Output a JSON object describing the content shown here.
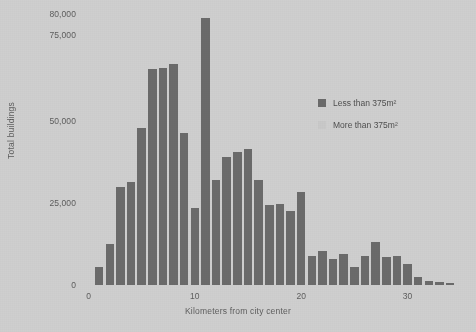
{
  "chart_data": {
    "type": "bar",
    "title": "",
    "xlabel": "Kilometers from city center",
    "ylabel": "Total buildings",
    "xlim": [
      -0.8,
      35.5
    ],
    "ylim": [
      0,
      80000
    ],
    "grid": false,
    "legend_position": "top-right",
    "ytick_labels": [
      "0",
      "25,000",
      "50,000",
      "75,000",
      "80,000"
    ],
    "ytick_values": [
      0,
      25000,
      50000,
      75000,
      80000
    ],
    "ytick_pixel_fractions": [
      0,
      0.3025,
      0.605,
      0.9225,
      1.0
    ],
    "xtick_labels": [
      "0",
      "10",
      "20",
      "30"
    ],
    "xtick_values": [
      0,
      10,
      20,
      30
    ],
    "series": [
      {
        "name": "Less than 375m²",
        "color": "#6b6b6b",
        "x": [
          1,
          2,
          3,
          4,
          5,
          6,
          7,
          8,
          9,
          10,
          11,
          12,
          13,
          14,
          15,
          16,
          17,
          18,
          19,
          20,
          21,
          22,
          23,
          24,
          25,
          26,
          27,
          28,
          29,
          30,
          31,
          32,
          33,
          34
        ],
        "values": [
          5500,
          12500,
          30000,
          31500,
          48000,
          65000,
          65500,
          66500,
          46500,
          23500,
          79000,
          32000,
          39000,
          40500,
          41500,
          32000,
          24500,
          24800,
          22500,
          28500,
          9000,
          10500,
          8000,
          9500,
          5500,
          9000,
          13000,
          8500,
          9000,
          6500,
          2500,
          1200,
          900,
          600
        ]
      },
      {
        "name": "More than 375m²",
        "color": "#c9c9c9",
        "x": [],
        "values": []
      }
    ]
  },
  "legend": {
    "entries": [
      {
        "label": "Less than 375m²",
        "color": "#6b6b6b"
      },
      {
        "label": "More than 375m²",
        "color": "#c9c9c9"
      }
    ]
  },
  "theme": {
    "background": "#cfcfcf",
    "text_color": "#5d5d5d",
    "bar_color": "#6b6b6b"
  }
}
